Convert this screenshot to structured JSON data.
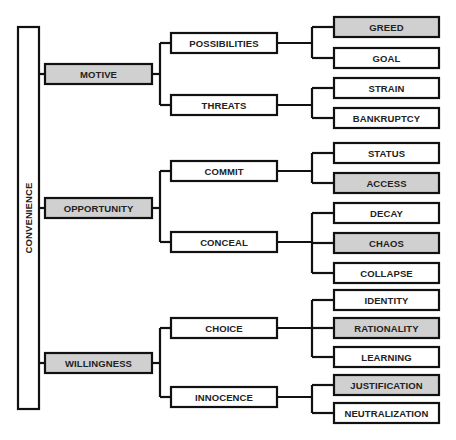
{
  "root": {
    "label": "CONVENIENCE",
    "shaded": false
  },
  "colors": {
    "shaded_fill": "#d0d0d0",
    "plain_fill": "#ffffff",
    "stroke": "#111111",
    "text": "#222222"
  },
  "dimensions": [
    {
      "label": "MOTIVE",
      "shaded": true,
      "children": [
        {
          "label": "POSSIBILITIES",
          "shaded": false,
          "children": [
            {
              "label": "GREED",
              "shaded": true
            },
            {
              "label": "GOAL",
              "shaded": false
            }
          ]
        },
        {
          "label": "THREATS",
          "shaded": false,
          "children": [
            {
              "label": "STRAIN",
              "shaded": false
            },
            {
              "label": "BANKRUPTCY",
              "shaded": false
            }
          ]
        }
      ]
    },
    {
      "label": "OPPORTUNITY",
      "shaded": true,
      "children": [
        {
          "label": "COMMIT",
          "shaded": false,
          "children": [
            {
              "label": "STATUS",
              "shaded": false
            },
            {
              "label": "ACCESS",
              "shaded": true
            }
          ]
        },
        {
          "label": "CONCEAL",
          "shaded": false,
          "children": [
            {
              "label": "DECAY",
              "shaded": false
            },
            {
              "label": "CHAOS",
              "shaded": true
            },
            {
              "label": "COLLAPSE",
              "shaded": false
            }
          ]
        }
      ]
    },
    {
      "label": "WILLINGNESS",
      "shaded": true,
      "children": [
        {
          "label": "CHOICE",
          "shaded": false,
          "children": [
            {
              "label": "IDENTITY",
              "shaded": false
            },
            {
              "label": "RATIONALITY",
              "shaded": true
            },
            {
              "label": "LEARNING",
              "shaded": false
            }
          ]
        },
        {
          "label": "INNOCENCE",
          "shaded": false,
          "children": [
            {
              "label": "JUSTIFICATION",
              "shaded": true
            },
            {
              "label": "NEUTRALIZATION",
              "shaded": false
            }
          ]
        }
      ]
    }
  ]
}
